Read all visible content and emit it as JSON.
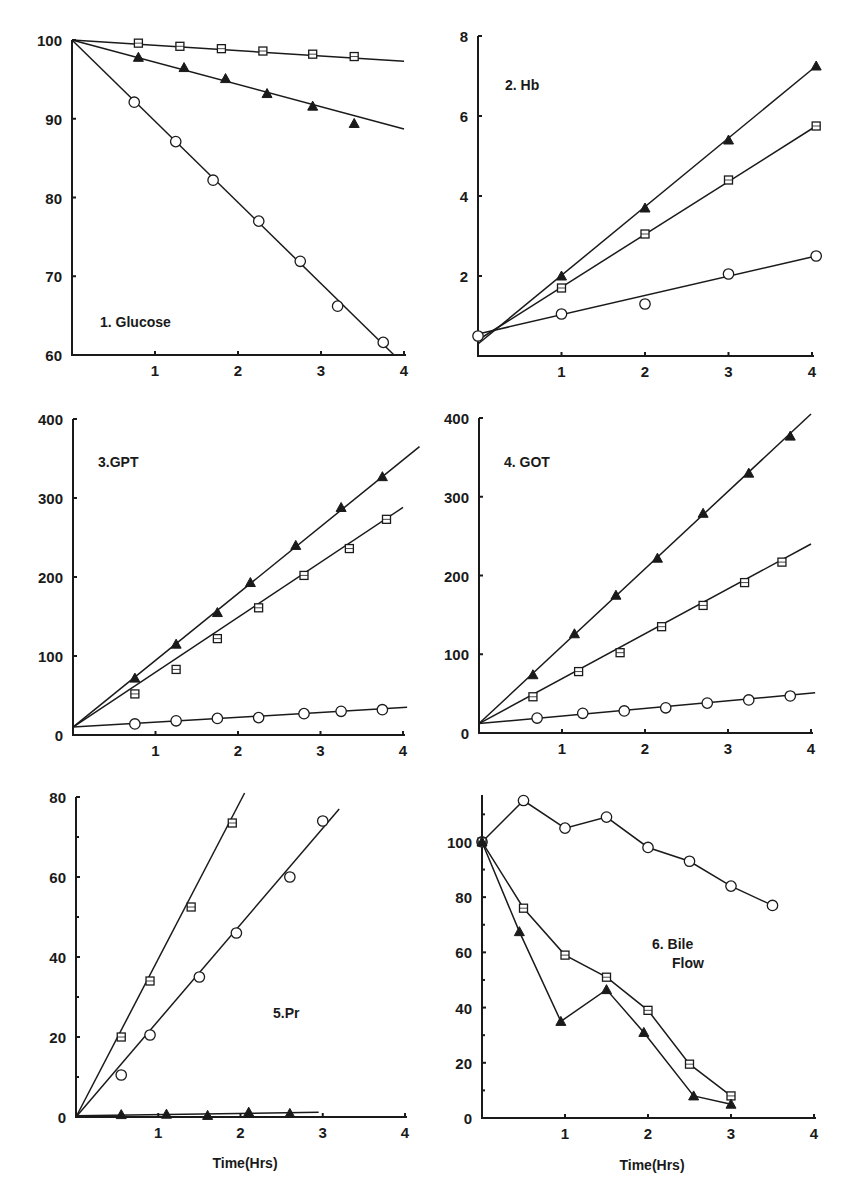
{
  "chart_data": [
    {
      "id": "p1",
      "type": "line",
      "title": "1. Glucose",
      "xlabel": "",
      "ylabel": "",
      "xlim": [
        0,
        4
      ],
      "ylim": [
        60,
        100
      ],
      "xticks": [
        1,
        2,
        3,
        4
      ],
      "yticks": [
        60,
        70,
        80,
        90,
        100
      ],
      "ytick_labels": [
        "60",
        "70",
        "80",
        "90",
        "100"
      ],
      "grid": false,
      "frame": {
        "x0": 72,
        "x4": 404,
        "ybot": 355,
        "ytop": 40
      },
      "title_pos": [
        100,
        327
      ],
      "series": [
        {
          "name": "square",
          "marker": "square",
          "fit": [
            [
              0,
              100
            ],
            [
              4,
              97.3
            ]
          ],
          "x": [
            0.8,
            1.3,
            1.8,
            2.3,
            2.9,
            3.4
          ],
          "y": [
            99.6,
            99.2,
            98.9,
            98.6,
            98.2,
            97.9
          ]
        },
        {
          "name": "triangle",
          "marker": "triangle",
          "fit": [
            [
              0,
              100
            ],
            [
              4,
              88.7
            ]
          ],
          "x": [
            0.8,
            1.35,
            1.85,
            2.35,
            2.9,
            3.4
          ],
          "y": [
            97.8,
            96.5,
            95.1,
            93.2,
            91.6,
            89.4
          ]
        },
        {
          "name": "circle",
          "marker": "circle",
          "fit": [
            [
              0,
              100
            ],
            [
              3.88,
              60
            ]
          ],
          "x": [
            0.75,
            1.25,
            1.7,
            2.25,
            2.75,
            3.2,
            3.75
          ],
          "y": [
            92.1,
            87.1,
            82.2,
            77.0,
            71.9,
            66.2,
            61.6
          ]
        }
      ]
    },
    {
      "id": "p2",
      "type": "line",
      "title": "2. Hb",
      "xlabel": "",
      "ylabel": "",
      "xlim": [
        0,
        4
      ],
      "ylim": [
        0,
        8
      ],
      "xticks": [
        1,
        2,
        3,
        4
      ],
      "yticks": [
        2,
        4,
        6,
        8
      ],
      "ytick_labels": [
        "2",
        "4",
        "6",
        "8"
      ],
      "grid": false,
      "frame": {
        "x0": 478,
        "x4": 812,
        "ybot": 356,
        "ytop": 36
      },
      "title_pos": [
        505,
        90
      ],
      "series": [
        {
          "name": "triangle",
          "marker": "triangle",
          "fit": [
            [
              0,
              0.3
            ],
            [
              4.05,
              7.25
            ]
          ],
          "x": [
            1,
            2,
            3,
            4.05
          ],
          "y": [
            2.0,
            3.7,
            5.4,
            7.25
          ]
        },
        {
          "name": "square",
          "marker": "square",
          "fit": [
            [
              0,
              0.4
            ],
            [
              4.05,
              5.75
            ]
          ],
          "x": [
            1,
            2,
            3,
            4.05
          ],
          "y": [
            1.7,
            3.05,
            4.4,
            5.75
          ]
        },
        {
          "name": "circle",
          "marker": "circle",
          "fit": [
            [
              0,
              0.55
            ],
            [
              4.05,
              2.5
            ]
          ],
          "x": [
            0,
            1,
            2,
            3,
            4.05
          ],
          "y": [
            0.5,
            1.05,
            1.3,
            2.05,
            2.5
          ]
        }
      ]
    },
    {
      "id": "p3",
      "type": "line",
      "title": "3.GPT",
      "xlabel": "",
      "ylabel": "",
      "xlim": [
        0,
        4
      ],
      "ylim": [
        0,
        400
      ],
      "xticks": [
        1,
        2,
        3,
        4
      ],
      "yticks": [
        0,
        100,
        200,
        300,
        400
      ],
      "ytick_labels": [
        "0",
        "100",
        "200",
        "300",
        "400"
      ],
      "grid": false,
      "frame": {
        "x0": 73,
        "x4": 403,
        "ybot": 735,
        "ytop": 419
      },
      "title_pos": [
        98,
        467
      ],
      "series": [
        {
          "name": "triangle",
          "marker": "triangle",
          "fit": [
            [
              0,
              10
            ],
            [
              4.2,
              365
            ]
          ],
          "x": [
            0.75,
            1.25,
            1.75,
            2.15,
            2.7,
            3.25,
            3.75
          ],
          "y": [
            72,
            115,
            155,
            193,
            240,
            288,
            327
          ]
        },
        {
          "name": "square",
          "marker": "square",
          "fit": [
            [
              0,
              10
            ],
            [
              4.0,
              288
            ]
          ],
          "x": [
            0.75,
            1.25,
            1.75,
            2.25,
            2.8,
            3.35,
            3.8
          ],
          "y": [
            52,
            83,
            122,
            161,
            202,
            236,
            273
          ]
        },
        {
          "name": "circle",
          "marker": "circle",
          "fit": [
            [
              0,
              10
            ],
            [
              4.05,
              35
            ]
          ],
          "x": [
            0.75,
            1.25,
            1.75,
            2.25,
            2.8,
            3.25,
            3.75
          ],
          "y": [
            14,
            18,
            21,
            22,
            27,
            30,
            32
          ]
        }
      ]
    },
    {
      "id": "p4",
      "type": "line",
      "title": "4. GOT",
      "xlabel": "",
      "ylabel": "",
      "xlim": [
        0,
        4
      ],
      "ylim": [
        0,
        400
      ],
      "xticks": [
        1,
        2,
        3,
        4
      ],
      "yticks": [
        0,
        100,
        200,
        300,
        400
      ],
      "ytick_labels": [
        "0",
        "100",
        "200",
        "300",
        "400"
      ],
      "grid": false,
      "frame": {
        "x0": 479,
        "x4": 811,
        "ybot": 733,
        "ytop": 418
      },
      "title_pos": [
        504,
        467
      ],
      "series": [
        {
          "name": "triangle",
          "marker": "triangle",
          "fit": [
            [
              0,
              12
            ],
            [
              4.0,
              405
            ]
          ],
          "x": [
            0.65,
            1.15,
            1.65,
            2.15,
            2.7,
            3.25,
            3.75
          ],
          "y": [
            74,
            126,
            175,
            222,
            279,
            330,
            377
          ]
        },
        {
          "name": "square",
          "marker": "square",
          "fit": [
            [
              0,
              12
            ],
            [
              4.0,
              240
            ]
          ],
          "x": [
            0.65,
            1.2,
            1.7,
            2.2,
            2.7,
            3.2,
            3.65
          ],
          "y": [
            46,
            78,
            102,
            135,
            162,
            191,
            217
          ]
        },
        {
          "name": "circle",
          "marker": "circle",
          "fit": [
            [
              0,
              12
            ],
            [
              4.05,
              51
            ]
          ],
          "x": [
            0.7,
            1.25,
            1.75,
            2.25,
            2.75,
            3.25,
            3.75
          ],
          "y": [
            19,
            25,
            28,
            32,
            38,
            42,
            47
          ]
        }
      ]
    },
    {
      "id": "p5",
      "type": "line",
      "title": "5.Pr",
      "xlabel": "Time(Hrs)",
      "ylabel": "",
      "xlim": [
        0,
        4
      ],
      "ylim": [
        0,
        80
      ],
      "xticks": [
        1,
        2,
        3,
        4
      ],
      "yticks": [
        0,
        20,
        40,
        60,
        80
      ],
      "ytick_labels": [
        "0",
        "20",
        "40",
        "60",
        "80"
      ],
      "minor_yticks": [
        10,
        30,
        50,
        70
      ],
      "grid": false,
      "frame": {
        "x0": 76,
        "x4": 405,
        "ybot": 1117,
        "ytop": 797
      },
      "title_pos": [
        273,
        1018
      ],
      "xlabel_pos": [
        245,
        1168
      ],
      "series": [
        {
          "name": "square",
          "marker": "square",
          "fit": [
            [
              0,
              0
            ],
            [
              2.05,
              81
            ]
          ],
          "x": [
            0.55,
            0.9,
            1.4,
            1.9
          ],
          "y": [
            20,
            34,
            52.5,
            73.5
          ]
        },
        {
          "name": "circle",
          "marker": "circle",
          "fit": [
            [
              0,
              0
            ],
            [
              3.2,
              77
            ]
          ],
          "x": [
            0.55,
            0.9,
            1.5,
            1.95,
            2.6,
            3.0
          ],
          "y": [
            10.5,
            20.5,
            35,
            46,
            60,
            74
          ]
        },
        {
          "name": "triangle",
          "marker": "triangle",
          "fit": [
            [
              0,
              0.3
            ],
            [
              2.95,
              1.2
            ]
          ],
          "x": [
            0.55,
            1.1,
            1.6,
            2.1,
            2.6
          ],
          "y": [
            0.6,
            0.7,
            0.4,
            1.2,
            0.9
          ]
        }
      ]
    },
    {
      "id": "p6",
      "type": "line",
      "title": "6. Bile",
      "title2": "Flow",
      "xlabel": "Time(Hrs)",
      "ylabel": "",
      "xlim": [
        0,
        4
      ],
      "ylim": [
        0,
        117
      ],
      "xticks": [
        1,
        2,
        3,
        4
      ],
      "yticks": [
        0,
        20,
        40,
        60,
        80,
        100
      ],
      "ytick_labels": [
        "0",
        "20",
        "40",
        "60",
        "80",
        "100"
      ],
      "minor_yticks": [
        10,
        30,
        50,
        70,
        90,
        110
      ],
      "grid": false,
      "frame": {
        "x0": 482,
        "x4": 814,
        "ybot": 1118,
        "ytop": 795
      },
      "title_pos": [
        652,
        949
      ],
      "title2_pos": [
        672,
        968
      ],
      "xlabel_pos": [
        652,
        1170
      ],
      "connected": true,
      "series": [
        {
          "name": "circle",
          "marker": "circle",
          "x": [
            0,
            0.5,
            1.0,
            1.5,
            2.0,
            2.5,
            3.0,
            3.5
          ],
          "y": [
            100,
            115,
            105,
            109,
            98,
            93,
            84,
            77
          ]
        },
        {
          "name": "square",
          "marker": "square",
          "x": [
            0,
            0.5,
            1.0,
            1.5,
            2.0,
            2.5,
            3.0
          ],
          "y": [
            100,
            76,
            59,
            51,
            39,
            19.5,
            8
          ]
        },
        {
          "name": "triangle",
          "marker": "triangle",
          "x": [
            0,
            0.45,
            0.95,
            1.5,
            1.95,
            2.55,
            3.0
          ],
          "y": [
            100,
            67.5,
            35,
            46.5,
            31,
            8,
            5
          ]
        }
      ]
    }
  ]
}
